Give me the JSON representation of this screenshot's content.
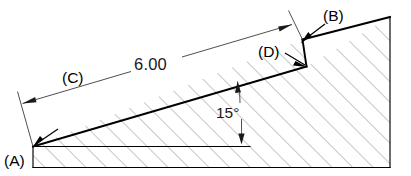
{
  "drawing": {
    "title": "Inclined wedge block with notch - dimensioned section view",
    "type": "engineering-section-view",
    "background_color": "#ffffff",
    "line_color": "#000000",
    "hatch_color": "#7a7a7a",
    "dimensions": {
      "length": {
        "value": "6.00",
        "kind": "linear",
        "measures": "inclined surface from vertex A to notch top",
        "placement": "aligned-along-incline"
      },
      "angle": {
        "value": "15°",
        "kind": "angular",
        "measures": "incline relative to horizontal base reference",
        "placement": "between inclined face and horizontal reference line"
      }
    },
    "balloons": [
      {
        "id": "A",
        "label": "(A)",
        "points_to": "bottom-left vertex where incline meets base",
        "position": "lower-left"
      },
      {
        "id": "B",
        "label": "(B)",
        "points_to": "top edge of notch / start of upper inclined face",
        "position": "upper-right"
      },
      {
        "id": "C",
        "label": "(C)",
        "points_to": "inclined surface (dimension leader region)",
        "position": "upper-left-of-incline"
      },
      {
        "id": "D",
        "label": "(D)",
        "points_to": "base of vertical notch face",
        "position": "right-of-center"
      }
    ],
    "features": {
      "base": "horizontal bottom edge",
      "right_edge": "vertical right edge",
      "incline": "long inclined face rising left to right at 15°",
      "notch": "small vertical step near upper right",
      "hatching": "45-degree section hatching throughout body"
    }
  }
}
